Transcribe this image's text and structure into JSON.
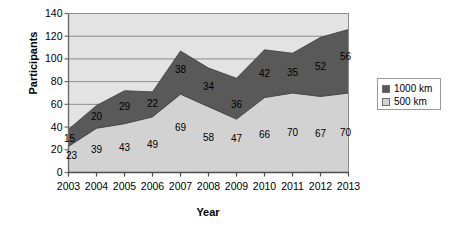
{
  "chart_data": {
    "type": "area",
    "stacked": true,
    "title": "",
    "xlabel": "Year",
    "ylabel": "Participants",
    "categories": [
      "2003",
      "2004",
      "2005",
      "2006",
      "2007",
      "2008",
      "2009",
      "2010",
      "2011",
      "2012",
      "2013"
    ],
    "series": [
      {
        "name": "500 km",
        "color": "#d2d2d2",
        "values": [
          23,
          39,
          43,
          49,
          69,
          58,
          47,
          66,
          70,
          67,
          70
        ]
      },
      {
        "name": "1000 km",
        "color": "#595959",
        "values": [
          15,
          20,
          29,
          22,
          38,
          34,
          36,
          42,
          35,
          52,
          56
        ]
      }
    ],
    "totals": [
      38,
      59,
      72,
      71,
      107,
      92,
      83,
      108,
      105,
      119,
      126
    ],
    "ylim": [
      0,
      140
    ],
    "yticks": [
      0,
      20,
      40,
      60,
      80,
      100,
      120,
      140
    ],
    "ytick_labels": [
      "0",
      "20",
      "40",
      "60",
      "80",
      "100",
      "120",
      "140"
    ],
    "grid": true,
    "legend_position": "right",
    "plot_background": "#e3e3e3",
    "axis_color": "#808080"
  },
  "legend": {
    "entries": [
      {
        "label": "1000 km",
        "color": "#595959"
      },
      {
        "label": "500 km",
        "color": "#d2d2d2"
      }
    ]
  }
}
